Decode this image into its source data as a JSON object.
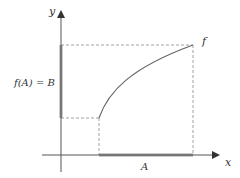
{
  "diagram": {
    "type": "function-image-illustration",
    "labels": {
      "y_axis": "y",
      "x_axis": "x",
      "function": "f",
      "range_segment": "f(A) = B",
      "domain_segment": "A"
    },
    "colors": {
      "axis": "#555555",
      "curve": "#666666",
      "dashed": "#888888",
      "highlight_segment": "#999999",
      "text": "#333333"
    },
    "geometry": {
      "origin": [
        61,
        155
      ],
      "x_axis_range": [
        42,
        219
      ],
      "y_axis_range": [
        172,
        10
      ],
      "domain_segment_x": [
        99,
        193
      ],
      "range_segment_y": [
        45,
        118
      ],
      "curve_start": [
        99,
        118
      ],
      "curve_end": [
        193,
        45
      ]
    }
  }
}
